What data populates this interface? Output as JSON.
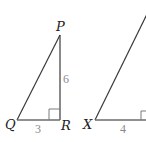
{
  "diagram": {
    "type": "similar-right-triangles",
    "triangle_1": {
      "vertices": {
        "P": "P",
        "Q": "Q",
        "R": "R"
      },
      "right_angle_at": "R",
      "sides": {
        "QR": "3",
        "PR": "6"
      }
    },
    "triangle_2": {
      "vertices": {
        "X": "X"
      },
      "right_angle_at": "unlabeled (cropped)",
      "sides": {
        "base": "4"
      }
    },
    "colors": {
      "line": "#3a3a3a",
      "length_label": "#8a8a8a",
      "vertex_label": "#222222",
      "background": "#ffffff"
    }
  }
}
